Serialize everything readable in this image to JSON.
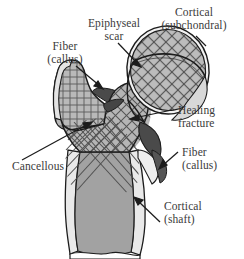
{
  "figure": {
    "background": "#ffffff",
    "colors": {
      "outline": "#1c1c1c",
      "cancellous_fill": "#b5b5b5",
      "cortical_light": "#e9e9e9",
      "medullary_fill": "#a2a2a2",
      "callus_dark": "#4a4a4a",
      "head_fill": "#bcbcbc",
      "hatch_line": "#555555",
      "label_text": "#3a3a3a",
      "leader_line": "#1c1c1c"
    }
  },
  "labels": {
    "cortical_subchondral": {
      "line1": "Cortical",
      "line2": "(subchondral)"
    },
    "epiphyseal_scar": {
      "line1": "Epiphyseal",
      "line2": "scar"
    },
    "fiber_callus_top": {
      "line1": "Fiber",
      "line2": "(callus)"
    },
    "healing_fracture": {
      "line1": "Healing",
      "line2": "fracture"
    },
    "fiber_callus_right": {
      "line1": "Fiber",
      "line2": "(callus)"
    },
    "cancellous": {
      "line1": "Cancellous",
      "line2": ""
    },
    "cortical_shaft": {
      "line1": "Cortical",
      "line2": "(shaft)"
    }
  }
}
